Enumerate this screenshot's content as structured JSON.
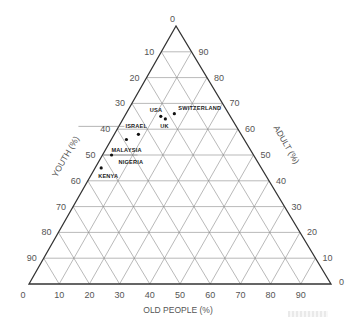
{
  "chart_data": {
    "type": "ternary-scatter",
    "title": "",
    "axes": {
      "youth": {
        "label": "YOUTH (%)",
        "edge": "left",
        "ticks": [
          0,
          10,
          20,
          30,
          40,
          50,
          60,
          70,
          80,
          90
        ]
      },
      "adult": {
        "label": "ADULT (%)",
        "edge": "right",
        "ticks": [
          90,
          80,
          70,
          60,
          50,
          40,
          30,
          20,
          10,
          0
        ]
      },
      "old_people": {
        "label": "OLD PEOPLE (%)",
        "edge": "bottom",
        "ticks": [
          0,
          10,
          20,
          30,
          40,
          50,
          60,
          70,
          80,
          90
        ]
      }
    },
    "grid": true,
    "grid_step": 10,
    "points": [
      {
        "label": "SWITZERLAND",
        "youth": 34,
        "old_people": 16,
        "adult": 50
      },
      {
        "label": "USA",
        "youth": 35,
        "old_people": 12,
        "adult": 53
      },
      {
        "label": "UK",
        "youth": 36,
        "old_people": 14,
        "adult": 50
      },
      {
        "label": "ISRAEL",
        "youth": 42,
        "old_people": 8,
        "adult": 50
      },
      {
        "label": "MALAYSIA",
        "youth": 44,
        "old_people": 5,
        "adult": 51
      },
      {
        "label": "NIGERIA",
        "youth": 50,
        "old_people": 3,
        "adult": 47
      },
      {
        "label": "KENYA",
        "youth": 55,
        "old_people": 2,
        "adult": 43
      }
    ]
  },
  "labels": {
    "youth_axis": "YOUTH (%)",
    "adult_axis": "ADULT (%)",
    "old_axis": "OLD PEOPLE (%)",
    "apex_tick": "0",
    "right_corner_tick": "0"
  },
  "point_labels": {
    "switzerland": "SWITZERLAND",
    "usa": "USA",
    "uk": "UK",
    "israel": "ISRAEL",
    "malaysia": "MALAYSIA",
    "nigeria": "NIGERIA",
    "kenya": "KENYA"
  }
}
